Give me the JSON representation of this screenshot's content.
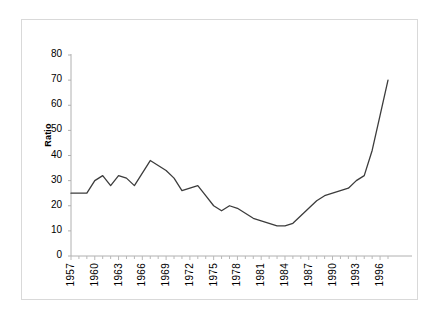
{
  "chart_data": {
    "type": "line",
    "title": "",
    "xlabel": "",
    "ylabel": "Ratio",
    "ylim": [
      0,
      80
    ],
    "ytick_values": [
      0,
      10,
      20,
      30,
      40,
      50,
      60,
      70,
      80
    ],
    "xlim": [
      1957,
      1997
    ],
    "xtick_labels": [
      "1957",
      "1960",
      "1963",
      "1966",
      "1969",
      "1972",
      "1975",
      "1978",
      "1981",
      "1984",
      "1987",
      "1990",
      "1993",
      "1996"
    ],
    "xtick_values": [
      1957,
      1960,
      1963,
      1966,
      1969,
      1972,
      1975,
      1978,
      1981,
      1984,
      1987,
      1990,
      1993,
      1996
    ],
    "grid": false,
    "legend": null,
    "line_color": "#3c3c3c",
    "x": [
      1957,
      1958,
      1959,
      1960,
      1961,
      1962,
      1963,
      1964,
      1965,
      1966,
      1967,
      1968,
      1969,
      1970,
      1971,
      1972,
      1973,
      1974,
      1975,
      1976,
      1977,
      1978,
      1979,
      1980,
      1981,
      1982,
      1983,
      1984,
      1985,
      1986,
      1987,
      1988,
      1989,
      1990,
      1991,
      1992,
      1993,
      1994,
      1995,
      1996,
      1997
    ],
    "values": [
      25,
      25,
      25,
      30,
      32,
      28,
      32,
      31,
      28,
      33,
      38,
      36,
      34,
      31,
      26,
      27,
      28,
      24,
      20,
      18,
      20,
      19,
      17,
      15,
      14,
      13,
      12,
      12,
      13,
      16,
      19,
      22,
      24,
      25,
      26,
      27,
      30,
      32,
      42,
      56,
      70
    ]
  }
}
